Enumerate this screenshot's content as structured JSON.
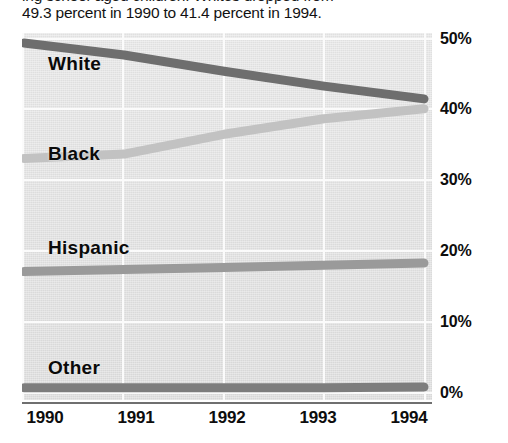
{
  "caption": {
    "cut_line": "ing school-aged children. Whites dropped from",
    "line": "49.3 percent in 1990 to 41.4 percent in 1994."
  },
  "chart_data": {
    "type": "line",
    "title": "",
    "subtitle": "",
    "xlabel": "",
    "ylabel": "",
    "x": [
      "1990",
      "1991",
      "1992",
      "1993",
      "1994"
    ],
    "categories": [
      "1990",
      "1991",
      "1992",
      "1993",
      "1994"
    ],
    "ylim": [
      0,
      52
    ],
    "xlim": [
      "1990",
      "1994"
    ],
    "yticks": [
      "0%",
      "10%",
      "20%",
      "30%",
      "40%",
      "50%"
    ],
    "ytick_values": [
      0,
      10,
      20,
      30,
      40,
      50
    ],
    "ytick_position": "right",
    "grid": true,
    "legend": "inline-labels",
    "legend_position": "inline-left",
    "series": [
      {
        "name": "White",
        "label": "White",
        "values": [
          49.3,
          47.6,
          45.3,
          43.2,
          41.4
        ],
        "color": "#6e6e6e"
      },
      {
        "name": "Black",
        "label": "Black",
        "values": [
          33.0,
          33.6,
          36.4,
          38.6,
          40.0
        ],
        "color": "#c2c2c2"
      },
      {
        "name": "Hispanic",
        "label": "Hispanic",
        "values": [
          17.0,
          17.3,
          17.6,
          17.9,
          18.2
        ],
        "color": "#9a9a9a"
      },
      {
        "name": "Other",
        "label": "Other",
        "values": [
          0.6,
          0.6,
          0.6,
          0.6,
          0.7
        ],
        "color": "#7d7d7d"
      }
    ]
  },
  "axis": {
    "y": {
      "t50": "50%",
      "t40": "40%",
      "t30": "30%",
      "t20": "20%",
      "t10": "10%",
      "t0": "0%"
    },
    "x": {
      "t1990": "1990",
      "t1991": "1991",
      "t1992": "1992",
      "t1993": "1993",
      "t1994": "1994"
    }
  },
  "series_labels": {
    "white": "White",
    "black": "Black",
    "hispanic": "Hispanic",
    "other": "Other"
  },
  "colors": {
    "white_series": "#6e6e6e",
    "black_series": "#c2c2c2",
    "hispanic_series": "#9a9a9a",
    "other_series": "#7d7d7d",
    "plot_background": "#e4e4e4",
    "gridline": "#fbfbfb",
    "axis": "#6f6f6f",
    "text": "#0d0d0d"
  }
}
